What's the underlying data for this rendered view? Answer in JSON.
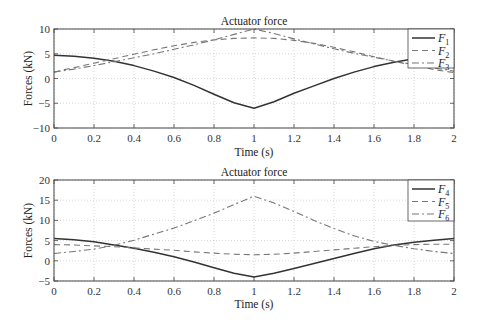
{
  "chart_data": [
    {
      "type": "line",
      "title": "Actuator force",
      "xlabel": "Time (s)",
      "ylabel": "Forces (kN)",
      "xlim": [
        0,
        2
      ],
      "ylim": [
        -10,
        10
      ],
      "xticks": [
        "0",
        "0.2",
        "0.4",
        "0.6",
        "0.8",
        "1",
        "1.2",
        "1.4",
        "1.6",
        "1.8",
        "2"
      ],
      "yticks": [
        "10",
        "5",
        "0",
        "-5",
        "-10"
      ],
      "grid": true,
      "legend_position": "upper right",
      "x": [
        0,
        0.1,
        0.2,
        0.3,
        0.4,
        0.5,
        0.6,
        0.7,
        0.8,
        0.9,
        1.0,
        1.1,
        1.2,
        1.3,
        1.4,
        1.5,
        1.6,
        1.7,
        1.8,
        1.9,
        2.0
      ],
      "series": [
        {
          "name": "F1",
          "label_main": "F",
          "label_sub": "1",
          "style": "solid",
          "values": [
            4.7,
            4.5,
            4.1,
            3.5,
            2.6,
            1.5,
            0.2,
            -1.4,
            -3.2,
            -4.9,
            -6.0,
            -4.7,
            -3.0,
            -1.5,
            0.0,
            1.3,
            2.4,
            3.3,
            4.0,
            4.4,
            4.6
          ]
        },
        {
          "name": "F2",
          "label_main": "F",
          "label_sub": "2",
          "style": "dashed",
          "values": [
            1.3,
            2.2,
            3.1,
            4.0,
            4.9,
            5.8,
            6.6,
            7.3,
            7.8,
            8.1,
            8.2,
            8.1,
            7.7,
            7.1,
            6.3,
            5.4,
            4.4,
            3.5,
            2.6,
            1.8,
            1.2
          ]
        },
        {
          "name": "F3",
          "label_main": "F",
          "label_sub": "3",
          "style": "dashdot",
          "values": [
            1.3,
            1.9,
            2.6,
            3.4,
            4.2,
            5.0,
            5.9,
            6.8,
            7.8,
            8.9,
            10.0,
            9.1,
            8.0,
            7.0,
            6.0,
            5.1,
            4.3,
            3.5,
            2.8,
            2.1,
            1.5
          ]
        }
      ]
    },
    {
      "type": "line",
      "title": "Actuator force",
      "xlabel": "Time (s)",
      "ylabel": "Forces (kN)",
      "xlim": [
        0,
        2
      ],
      "ylim": [
        -5,
        20
      ],
      "xticks": [
        "0",
        "0.2",
        "0.4",
        "0.6",
        "0.8",
        "1",
        "1.2",
        "1.4",
        "1.6",
        "1.8",
        "2"
      ],
      "yticks": [
        "20",
        "15",
        "10",
        "5",
        "0",
        "-5"
      ],
      "grid": true,
      "legend_position": "upper right",
      "x": [
        0,
        0.1,
        0.2,
        0.3,
        0.4,
        0.5,
        0.6,
        0.7,
        0.8,
        0.9,
        1.0,
        1.1,
        1.2,
        1.3,
        1.4,
        1.5,
        1.6,
        1.7,
        1.8,
        1.9,
        2.0
      ],
      "series": [
        {
          "name": "F4",
          "label_main": "F",
          "label_sub": "4",
          "style": "solid",
          "values": [
            5.5,
            5.2,
            4.7,
            3.9,
            3.1,
            2.1,
            1.0,
            -0.3,
            -1.7,
            -3.1,
            -4.0,
            -3.1,
            -1.9,
            -0.7,
            0.6,
            1.8,
            3.0,
            3.9,
            4.6,
            5.1,
            5.5
          ]
        },
        {
          "name": "F5",
          "label_main": "F",
          "label_sub": "5",
          "style": "dashed",
          "values": [
            4.0,
            3.9,
            3.7,
            3.5,
            3.2,
            2.9,
            2.6,
            2.2,
            1.9,
            1.6,
            1.5,
            1.6,
            1.9,
            2.3,
            2.7,
            3.1,
            3.5,
            3.8,
            4.0,
            4.1,
            4.1
          ]
        },
        {
          "name": "F6",
          "label_main": "F",
          "label_sub": "6",
          "style": "dashdot",
          "values": [
            1.8,
            2.3,
            2.9,
            3.8,
            5.1,
            6.6,
            8.1,
            9.9,
            11.8,
            13.9,
            16.0,
            14.3,
            12.2,
            10.0,
            8.0,
            6.2,
            4.8,
            3.8,
            3.0,
            2.3,
            1.8
          ]
        }
      ]
    }
  ]
}
